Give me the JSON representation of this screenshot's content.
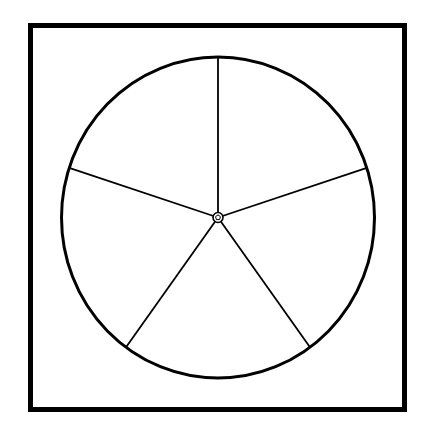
{
  "diagram": {
    "title": "",
    "sector_count": 5,
    "sectors": [
      {
        "index": 1,
        "label": ""
      },
      {
        "index": 2,
        "label": ""
      },
      {
        "index": 3,
        "label": ""
      },
      {
        "index": 4,
        "label": ""
      },
      {
        "index": 5,
        "label": ""
      }
    ],
    "colors": {
      "stroke": "#000000",
      "background": "#ffffff"
    }
  }
}
